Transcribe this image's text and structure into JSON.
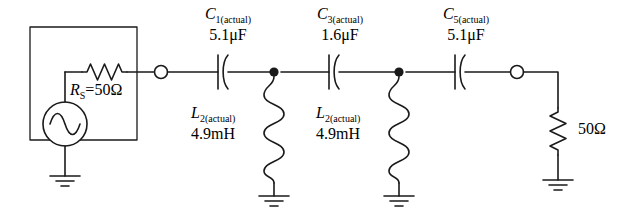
{
  "diagram": {
    "stroke_color": "#1a1a1a",
    "background_color": "#ffffff"
  },
  "source": {
    "box_label": "source-network-box",
    "ac_source_name": "ac-voltage-source",
    "resistor": {
      "symbol": "R",
      "subscript": "S",
      "equals": "=",
      "value": "50Ω",
      "full_text": "R_S =50Ω"
    }
  },
  "series_capacitors": [
    {
      "symbol": "C",
      "subscript": "1(actual)",
      "value": "5.1μF",
      "name": "capacitor-c1"
    },
    {
      "symbol": "C",
      "subscript": "3(actual)",
      "value": "1.6μF",
      "name": "capacitor-c3"
    },
    {
      "symbol": "C",
      "subscript": "5(actual)",
      "value": "5.1μF",
      "name": "capacitor-c5"
    }
  ],
  "shunt_inductors": [
    {
      "symbol": "L",
      "subscript": "2(actual)",
      "value": "4.9mH",
      "name": "inductor-l2-first"
    },
    {
      "symbol": "L",
      "subscript": "2(actual)",
      "value": "4.9mH",
      "name": "inductor-l2-second"
    }
  ],
  "load": {
    "value": "50Ω",
    "name": "load-resistor"
  },
  "terminals": {
    "input_terminal": "input-open-terminal",
    "output_terminal": "output-open-terminal"
  },
  "nodes": {
    "node_1": "junction-node-1",
    "node_2": "junction-node-2"
  },
  "grounds": {
    "source_ground": "ground-source",
    "l2a_ground": "ground-inductor-1",
    "l2b_ground": "ground-inductor-2",
    "load_ground": "ground-load"
  }
}
